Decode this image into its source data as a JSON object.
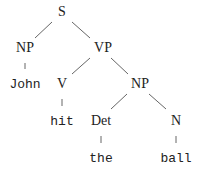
{
  "diagram": {
    "type": "parse-tree",
    "sentence": "John hit the ball",
    "colors": {
      "text": "#222222",
      "edge": "#666666",
      "background": "#ffffff"
    },
    "nodes": {
      "s": {
        "label": "S",
        "kind": "category",
        "x": 62,
        "y": 12
      },
      "np_subj": {
        "label": "NP",
        "kind": "category",
        "x": 25,
        "y": 48
      },
      "vp": {
        "label": "VP",
        "kind": "category",
        "x": 103,
        "y": 48
      },
      "john": {
        "label": "John",
        "kind": "word",
        "x": 25,
        "y": 84
      },
      "v": {
        "label": "V",
        "kind": "category",
        "x": 62,
        "y": 84
      },
      "np_obj": {
        "label": "NP",
        "kind": "category",
        "x": 140,
        "y": 84
      },
      "hit": {
        "label": "hit",
        "kind": "word",
        "x": 62,
        "y": 121
      },
      "det": {
        "label": "Det",
        "kind": "category",
        "x": 101,
        "y": 121
      },
      "n": {
        "label": "N",
        "kind": "category",
        "x": 176,
        "y": 121
      },
      "the": {
        "label": "the",
        "kind": "word",
        "x": 101,
        "y": 158
      },
      "ball": {
        "label": "ball",
        "kind": "word",
        "x": 176,
        "y": 158
      }
    },
    "edges": [
      {
        "from": "s",
        "to": "np_subj"
      },
      {
        "from": "s",
        "to": "vp"
      },
      {
        "from": "np_subj",
        "to": "john"
      },
      {
        "from": "vp",
        "to": "v"
      },
      {
        "from": "vp",
        "to": "np_obj"
      },
      {
        "from": "v",
        "to": "hit"
      },
      {
        "from": "np_obj",
        "to": "det"
      },
      {
        "from": "np_obj",
        "to": "n"
      },
      {
        "from": "det",
        "to": "the"
      },
      {
        "from": "n",
        "to": "ball"
      }
    ]
  }
}
